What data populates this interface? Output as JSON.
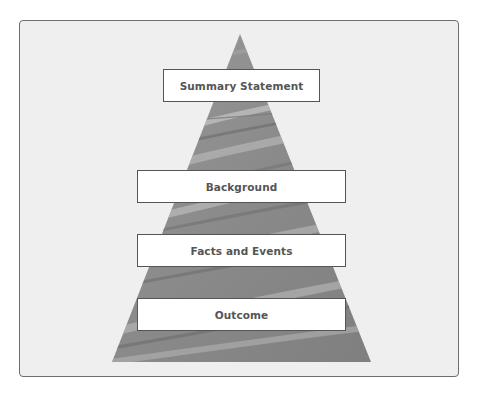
{
  "diagram": {
    "type": "pyramid",
    "colors": {
      "frame_bg": "#efefef",
      "frame_border": "#6e6e6e",
      "pyramid_fill": "#8e8e8e",
      "box_bg": "#ffffff",
      "box_border": "#555555",
      "text": "#555555"
    },
    "levels": [
      {
        "label": "Summary Statement"
      },
      {
        "label": "Background"
      },
      {
        "label": "Facts and Events"
      },
      {
        "label": "Outcome"
      }
    ]
  }
}
